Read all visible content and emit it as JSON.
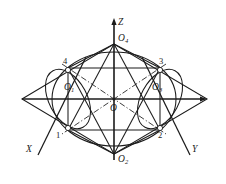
{
  "figure": {
    "stroke_color": "#1b1b1b",
    "background_color": "#ffffff",
    "axes": [
      {
        "name": "z-axis",
        "label": "Z",
        "direction": "up",
        "tip": [
          114,
          18
        ],
        "origin": [
          114,
          99
        ]
      },
      {
        "name": "x-axis",
        "label": "X",
        "direction": "lower-left",
        "tip": [
          35,
          158
        ],
        "origin": [
          114,
          99
        ]
      },
      {
        "name": "y-axis",
        "label": "Y",
        "direction": "lower-right",
        "tip": [
          193,
          158
        ],
        "origin": [
          114,
          99
        ]
      }
    ],
    "points": [
      {
        "name": "center",
        "label": "O",
        "sub": "",
        "x": 114,
        "y": 99,
        "marker": "none"
      },
      {
        "name": "top-vertex",
        "label": "O",
        "sub": "4",
        "x": 114,
        "y": 44,
        "marker": "none"
      },
      {
        "name": "bottom-vertex",
        "label": "O",
        "sub": "2",
        "x": 114,
        "y": 154,
        "marker": "none"
      },
      {
        "name": "left-center",
        "label": "O",
        "sub": "1",
        "x": 68,
        "y": 99,
        "marker": "none"
      },
      {
        "name": "right-center",
        "label": "O",
        "sub": "3",
        "x": 160,
        "y": 99,
        "marker": "none"
      },
      {
        "name": "vertex-4",
        "label": "4",
        "sub": "",
        "x": 68,
        "y": 68,
        "marker": "circle"
      },
      {
        "name": "vertex-3",
        "label": "3",
        "sub": "",
        "x": 160,
        "y": 68,
        "marker": "circle"
      },
      {
        "name": "vertex-2",
        "label": "2",
        "sub": "",
        "x": 160,
        "y": 130,
        "marker": "circle"
      },
      {
        "name": "vertex-1",
        "label": "1",
        "sub": "",
        "x": 68,
        "y": 130,
        "marker": "circle"
      }
    ],
    "labels": {
      "axis_z": "Z",
      "axis_x": "X",
      "axis_y": "Y",
      "origin": "O",
      "o1": "O",
      "o1_sub": "1",
      "o2": "O",
      "o2_sub": "2",
      "o3": "O",
      "o3_sub": "3",
      "o4": "O",
      "o4_sub": "4",
      "num1": "1",
      "num2": "2",
      "num3": "3",
      "num4": "4"
    },
    "ellipses": [
      {
        "name": "central-ellipse",
        "cx": 114,
        "cy": 99,
        "rx": 62,
        "ry": 47,
        "rotation": 0
      },
      {
        "name": "left-ellipse",
        "cx": 68,
        "cy": 99,
        "rx": 32,
        "ry": 19,
        "rotation": 62
      },
      {
        "name": "right-ellipse",
        "cx": 160,
        "cy": 99,
        "rx": 32,
        "ry": 19,
        "rotation": -62
      }
    ],
    "outer_diamond": [
      [
        22,
        99
      ],
      [
        114,
        44
      ],
      [
        207,
        99
      ],
      [
        114,
        154
      ]
    ],
    "inner_hexagon": [
      [
        68,
        68
      ],
      [
        160,
        68
      ],
      [
        160,
        130
      ],
      [
        68,
        130
      ]
    ]
  },
  "ghost_text": ""
}
